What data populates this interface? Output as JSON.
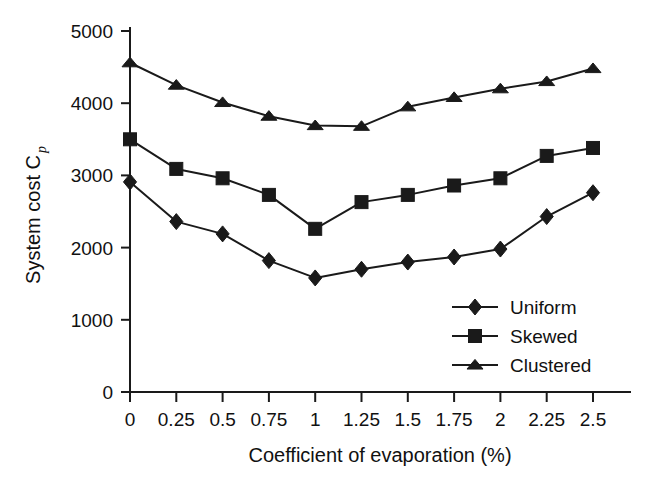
{
  "chart_data": {
    "type": "line",
    "title": "",
    "xlabel": "Coefficient of evaporation (%)",
    "ylabel": "System cost C",
    "ylabel_subscript": "p",
    "x": [
      0,
      0.25,
      0.5,
      0.75,
      1,
      1.25,
      1.5,
      1.75,
      2,
      2.25,
      2.5
    ],
    "xticklabels": [
      "0",
      "0.25",
      "0.5",
      "0.75",
      "1",
      "1.25",
      "1.5",
      "1.75",
      "2",
      "2.25",
      "2.5"
    ],
    "yticklabels": [
      "0",
      "1000",
      "2000",
      "3000",
      "4000",
      "5000"
    ],
    "yticks": [
      0,
      1000,
      2000,
      3000,
      4000,
      5000
    ],
    "xlim": [
      0,
      2.5
    ],
    "ylim": [
      0,
      5000
    ],
    "grid": false,
    "legend_position": "lower right",
    "series": [
      {
        "name": "Uniform",
        "marker": "diamond",
        "values": [
          2910,
          2360,
          2190,
          1820,
          1580,
          1700,
          1800,
          1870,
          1980,
          2430,
          2760
        ]
      },
      {
        "name": "Skewed",
        "marker": "square",
        "values": [
          3500,
          3090,
          2960,
          2730,
          2260,
          2630,
          2730,
          2860,
          2960,
          3270,
          3380
        ]
      },
      {
        "name": "Clustered",
        "marker": "triangle",
        "values": [
          4560,
          4250,
          4010,
          3820,
          3690,
          3680,
          3950,
          4080,
          4200,
          4300,
          4480
        ]
      }
    ],
    "colors": {
      "axis": "#1a1a1a",
      "series": "#1a1a1a",
      "background": "#ffffff"
    }
  },
  "legend": {
    "items": [
      {
        "label": "Uniform",
        "marker": "diamond"
      },
      {
        "label": "Skewed",
        "marker": "square"
      },
      {
        "label": "Clustered",
        "marker": "triangle"
      }
    ]
  }
}
